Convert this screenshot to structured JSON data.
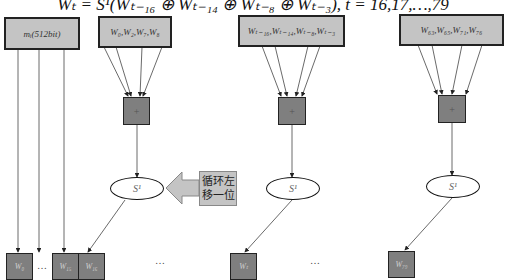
{
  "formula": "Wₜ = S¹(Wₜ₋₁₆ ⊕ Wₜ₋₁₄ ⊕ Wₜ₋₈ ⊕ Wₜ₋₃),   t = 16,17,…,79",
  "input_box": {
    "label": "mᵢ(512bit)"
  },
  "groups": [
    {
      "source_label": "W₀,W₂,W₇,W₈",
      "op_symbol": "+",
      "rotate_label": "S¹",
      "output_label": "W₁₆"
    },
    {
      "source_label": "Wₜ₋₁₆,Wₜ₋₁₄,Wₜ₋₈,Wₜ₋₃",
      "op_symbol": "+",
      "rotate_label": "S¹",
      "output_label": "Wₜ"
    },
    {
      "source_label": "W₆₃,W₆₅,W₇₁,W₇₆",
      "op_symbol": "+",
      "rotate_label": "S¹",
      "output_label": "W₇₉"
    }
  ],
  "bottom_row": {
    "first_label": "W₀",
    "ellipsis": "…",
    "last_label": "W₁₅"
  },
  "callout": {
    "line1": "循环左",
    "line2": "移一位"
  },
  "ellipses": [
    "…",
    "…"
  ],
  "colors": {
    "box_fill": "#c4c4c4",
    "square_fill": "#7f7f7f",
    "line": "#333333"
  }
}
